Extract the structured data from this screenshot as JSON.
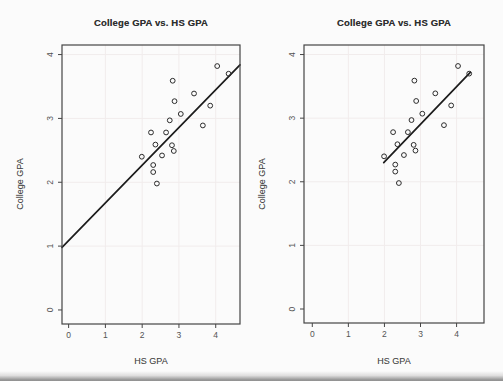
{
  "chart_data": [
    {
      "type": "scatter",
      "title": "College GPA vs. HS GPA",
      "xlabel": "HS GPA",
      "ylabel": "College GPA",
      "xlim": [
        -0.18,
        4.66
      ],
      "ylim": [
        -0.22,
        4.15
      ],
      "xticks": [
        0,
        1,
        2,
        3,
        4
      ],
      "yticks": [
        0,
        1,
        2,
        3,
        4
      ],
      "grid": true,
      "legend_position": "none",
      "marker": "open-circle",
      "points": [
        [
          2.83,
          3.59
        ],
        [
          4.04,
          3.82
        ],
        [
          4.35,
          3.7
        ],
        [
          3.41,
          3.39
        ],
        [
          2.88,
          3.27
        ],
        [
          3.85,
          3.2
        ],
        [
          3.05,
          3.07
        ],
        [
          2.75,
          2.97
        ],
        [
          2.24,
          2.78
        ],
        [
          2.65,
          2.78
        ],
        [
          3.65,
          2.89
        ],
        [
          2.36,
          2.59
        ],
        [
          2.81,
          2.58
        ],
        [
          2.86,
          2.49
        ],
        [
          2.54,
          2.42
        ],
        [
          1.99,
          2.4
        ],
        [
          2.3,
          2.27
        ],
        [
          2.3,
          2.16
        ],
        [
          2.4,
          1.98
        ]
      ],
      "regression_line": {
        "x1": -0.18,
        "y1": 0.98,
        "x2": 4.66,
        "y2": 3.84
      }
    },
    {
      "type": "scatter",
      "title": "College GPA vs. HS GPA",
      "xlabel": "HS GPA",
      "ylabel": "College GPA",
      "xlim": [
        -0.23,
        4.76
      ],
      "ylim": [
        -0.22,
        4.15
      ],
      "xticks": [
        0,
        1,
        2,
        3,
        4
      ],
      "yticks": [
        0,
        1,
        2,
        3,
        4
      ],
      "grid": true,
      "legend_position": "none",
      "marker": "open-circle",
      "points": [
        [
          2.83,
          3.59
        ],
        [
          4.04,
          3.82
        ],
        [
          4.35,
          3.7
        ],
        [
          3.41,
          3.39
        ],
        [
          2.88,
          3.27
        ],
        [
          3.85,
          3.2
        ],
        [
          3.05,
          3.07
        ],
        [
          2.75,
          2.97
        ],
        [
          2.24,
          2.78
        ],
        [
          2.65,
          2.78
        ],
        [
          3.65,
          2.89
        ],
        [
          2.36,
          2.59
        ],
        [
          2.81,
          2.58
        ],
        [
          2.86,
          2.49
        ],
        [
          2.54,
          2.42
        ],
        [
          1.99,
          2.4
        ],
        [
          2.3,
          2.27
        ],
        [
          2.3,
          2.16
        ],
        [
          2.4,
          1.98
        ]
      ],
      "regression_line": {
        "x1": 1.98,
        "y1": 2.3,
        "x2": 4.38,
        "y2": 3.72
      }
    }
  ],
  "colors": {
    "background": "#fbfbfb",
    "axis_box": "#454545",
    "point_stroke": "#2b2b2b",
    "line": "#1c1c1c",
    "grid": "#f1ecec",
    "tick_text": "#545454",
    "scan_edge": "#8f8f8f"
  }
}
